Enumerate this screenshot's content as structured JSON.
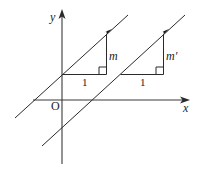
{
  "diagram": {
    "type": "coordinate-geometry",
    "axes": {
      "x_label": "x",
      "y_label": "y",
      "origin_label": "O"
    },
    "line_1": {
      "name": "upper-line",
      "triangle": {
        "run_label": "1",
        "rise_label": "m"
      }
    },
    "line_2": {
      "name": "lower-line",
      "triangle": {
        "run_label": "1",
        "rise_label": "m′"
      }
    },
    "colors": {
      "stroke": "#2a2a2a",
      "background": "#ffffff"
    }
  }
}
